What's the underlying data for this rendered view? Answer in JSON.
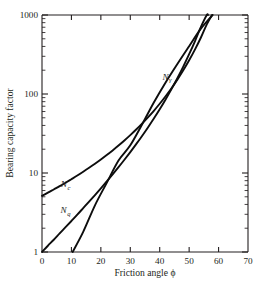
{
  "chart_data": {
    "type": "line",
    "title": "",
    "xlabel": "Friction angle ϕ",
    "ylabel": "Bearing capacity factor",
    "xlim": [
      0,
      70
    ],
    "ylim": [
      1,
      1000
    ],
    "yscale": "log",
    "xscale": "linear",
    "grid": false,
    "legend_position": "inline-curve-labels",
    "xticks": [
      0,
      10,
      20,
      30,
      40,
      50,
      60,
      70
    ],
    "xticklabels": [
      "0",
      "10",
      "20",
      "30",
      "40",
      "50",
      "60",
      "70"
    ],
    "yticks": [
      1,
      10,
      100,
      1000
    ],
    "yticklabels": [
      "1",
      "10",
      "100",
      "1000"
    ],
    "yminorticks": [
      2,
      3,
      4,
      5,
      6,
      7,
      8,
      9,
      20,
      30,
      40,
      50,
      60,
      70,
      80,
      90,
      200,
      300,
      400,
      500,
      600,
      700,
      800,
      900
    ],
    "tick_direction": "in",
    "x": [
      0,
      5,
      10,
      15,
      20,
      25,
      30,
      35,
      40,
      45,
      50,
      55,
      60,
      65,
      70
    ],
    "series": [
      {
        "name": "Nc",
        "label": "N",
        "label_sub": "c",
        "label_x": 8.0,
        "label_y": 6.6,
        "values": [
          5.14,
          6.49,
          8.35,
          10.98,
          14.83,
          20.72,
          30.14,
          46.12,
          75.31,
          133.87,
          266.88,
          621.5,
          1000,
          null,
          null
        ]
      },
      {
        "name": "Nq",
        "label": "N",
        "label_sub": "q",
        "label_x": 8.0,
        "label_y": 3.1,
        "values": [
          1.0,
          1.57,
          2.47,
          3.94,
          6.4,
          10.66,
          18.4,
          33.3,
          64.2,
          134.88,
          319.07,
          873.86,
          1000,
          null,
          null
        ]
      },
      {
        "name": "Ngamma",
        "label": "N",
        "label_sub": "γ",
        "label_x": 42.5,
        "label_y": 150,
        "values": [
          null,
          null,
          1.0,
          1.5,
          3.5,
          8.1,
          18.1,
          41.1,
          100.4,
          267.7,
          813.0,
          1000,
          null,
          null,
          null
        ]
      }
    ],
    "curve_points": {
      "Nc": [
        [
          0,
          5.14
        ],
        [
          2,
          5.63
        ],
        [
          4,
          6.19
        ],
        [
          6,
          6.81
        ],
        [
          8,
          7.53
        ],
        [
          10,
          8.35
        ],
        [
          12,
          9.28
        ],
        [
          14,
          10.37
        ],
        [
          16,
          11.63
        ],
        [
          18,
          13.1
        ],
        [
          20,
          14.83
        ],
        [
          22,
          16.88
        ],
        [
          24,
          19.32
        ],
        [
          26,
          22.25
        ],
        [
          28,
          25.8
        ],
        [
          30,
          30.14
        ],
        [
          32,
          35.49
        ],
        [
          34,
          42.16
        ],
        [
          36,
          50.59
        ],
        [
          38,
          61.35
        ],
        [
          40,
          75.31
        ],
        [
          42,
          93.71
        ],
        [
          44,
          118.37
        ],
        [
          46,
          152.1
        ],
        [
          48,
          199.26
        ],
        [
          50,
          266.88
        ],
        [
          52,
          366.66
        ],
        [
          54,
          519.0
        ],
        [
          56,
          762.0
        ],
        [
          57.8,
          1000
        ]
      ],
      "Nq": [
        [
          0,
          1.0
        ],
        [
          2,
          1.2
        ],
        [
          4,
          1.43
        ],
        [
          6,
          1.72
        ],
        [
          8,
          2.06
        ],
        [
          10,
          2.47
        ],
        [
          12,
          2.97
        ],
        [
          14,
          3.59
        ],
        [
          16,
          4.34
        ],
        [
          18,
          5.26
        ],
        [
          20,
          6.4
        ],
        [
          22,
          7.82
        ],
        [
          24,
          9.6
        ],
        [
          26,
          11.85
        ],
        [
          28,
          14.72
        ],
        [
          30,
          18.4
        ],
        [
          32,
          23.18
        ],
        [
          34,
          29.44
        ],
        [
          36,
          37.75
        ],
        [
          38,
          48.93
        ],
        [
          40,
          64.2
        ],
        [
          42,
          85.37
        ],
        [
          44,
          115.31
        ],
        [
          46,
          158.5
        ],
        [
          48,
          222.3
        ],
        [
          50,
          319.07
        ],
        [
          52,
          468.6
        ],
        [
          54,
          707.4
        ],
        [
          56,
          1000
        ],
        [
          56.4,
          1000
        ]
      ],
      "Ngamma": [
        [
          10.4,
          1.0
        ],
        [
          12,
          1.2
        ],
        [
          14,
          1.8
        ],
        [
          16,
          2.7
        ],
        [
          18,
          3.9
        ],
        [
          20,
          5.4
        ],
        [
          22,
          7.5
        ],
        [
          24,
          10.4
        ],
        [
          26,
          14.4
        ],
        [
          28,
          20.1
        ],
        [
          30,
          28.0
        ],
        [
          32,
          38.9
        ],
        [
          34,
          54.0
        ],
        [
          36,
          75.3
        ],
        [
          38,
          105.0
        ],
        [
          40,
          146.0
        ],
        [
          42,
          200.0
        ],
        [
          44,
          275.0
        ],
        [
          46,
          375.0
        ],
        [
          48,
          512.0
        ],
        [
          50,
          695.0
        ],
        [
          52,
          943.0
        ],
        [
          53,
          1000
        ]
      ],
      "Ngamma_right": [
        [
          10.4,
          1.0
        ],
        [
          14,
          1.8
        ],
        [
          18,
          3.9
        ],
        [
          22,
          7.5
        ],
        [
          26,
          14.4
        ],
        [
          30,
          22.4
        ],
        [
          34,
          41.1
        ],
        [
          38,
          78.0
        ],
        [
          42,
          140.0
        ],
        [
          46,
          240.0
        ],
        [
          50,
          403.0
        ],
        [
          54,
          672.0
        ],
        [
          58,
          1000
        ]
      ]
    }
  },
  "axis": {
    "x_title": "Friction angle ϕ",
    "y_title": "Bearing capacity factor",
    "xlabels": [
      "0",
      "10",
      "20",
      "30",
      "40",
      "50",
      "60",
      "70"
    ],
    "ylabels": [
      "1",
      "10",
      "100",
      "1000"
    ]
  },
  "colors": {
    "curve": "#0d0d0d",
    "axis": "#231f20",
    "background": "#ffffff"
  }
}
